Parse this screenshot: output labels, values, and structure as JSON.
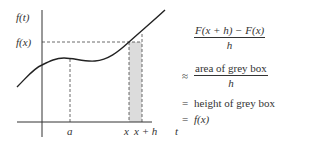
{
  "graph": {
    "y_axis_label": "f(t)",
    "fx_label": "f(x)",
    "x_axis_label": "t",
    "tick_a": "a",
    "tick_x": "x",
    "tick_xh": "x + h",
    "curve_color": "#222222",
    "box_fill": "#dcdcdc"
  },
  "equations": {
    "line1": {
      "relation": "",
      "numerator": "F(x + h) − F(x)",
      "denominator": "h"
    },
    "line2": {
      "relation": "≈",
      "numerator": "area of grey box",
      "denominator": "h"
    },
    "line3": {
      "relation": "=",
      "text": "height of grey box"
    },
    "line4": {
      "relation": "=",
      "text": "f(x)"
    }
  }
}
